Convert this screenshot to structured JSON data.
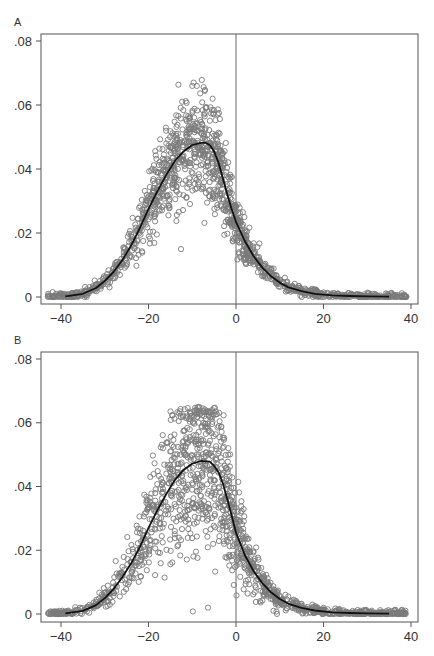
{
  "chart_data": [
    {
      "panel_label": "A",
      "type": "scatter",
      "title": "",
      "xlabel": "",
      "ylabel": "",
      "xlim": [
        -44,
        41
      ],
      "ylim": [
        0,
        0.08
      ],
      "xticks": [
        -40,
        -20,
        0,
        20,
        40
      ],
      "xtick_labels": [
        "−40",
        "−20",
        "0",
        "20",
        "40"
      ],
      "yticks": [
        0,
        0.02,
        0.04,
        0.06,
        0.08
      ],
      "ytick_labels": [
        "0",
        ".02",
        ".04",
        ".06",
        ".08"
      ],
      "reference_line_x": 0,
      "grid": false,
      "legend": "none",
      "series": [
        {
          "name": "observed",
          "kind": "scatter-hollow-circles",
          "color": "#7a7a7a",
          "x_range": [
            -43,
            39
          ],
          "peak_x": -8,
          "peak_y_max": 0.068,
          "noise_scale": 0.18
        },
        {
          "name": "fitted",
          "kind": "line",
          "color": "#111111",
          "x_range": [
            -39,
            35
          ],
          "points": [
            [
              -39,
              0.0002
            ],
            [
              -35,
              0.001
            ],
            [
              -32,
              0.0028
            ],
            [
              -30,
              0.005
            ],
            [
              -28,
              0.0078
            ],
            [
              -26,
              0.0115
            ],
            [
              -24,
              0.016
            ],
            [
              -22,
              0.0215
            ],
            [
              -20,
              0.0275
            ],
            [
              -18,
              0.033
            ],
            [
              -16,
              0.038
            ],
            [
              -14,
              0.0425
            ],
            [
              -12,
              0.0455
            ],
            [
              -10,
              0.0475
            ],
            [
              -8,
              0.0482
            ],
            [
              -7,
              0.0482
            ],
            [
              -6,
              0.0475
            ],
            [
              -5,
              0.0455
            ],
            [
              -4,
              0.042
            ],
            [
              -3,
              0.037
            ],
            [
              -2,
              0.032
            ],
            [
              -1,
              0.0275
            ],
            [
              0,
              0.0235
            ],
            [
              2,
              0.0175
            ],
            [
              4,
              0.0128
            ],
            [
              6,
              0.0092
            ],
            [
              8,
              0.0065
            ],
            [
              10,
              0.0045
            ],
            [
              12,
              0.003
            ],
            [
              15,
              0.0018
            ],
            [
              18,
              0.001
            ],
            [
              22,
              0.0005
            ],
            [
              26,
              0.0003
            ],
            [
              30,
              0.0002
            ],
            [
              35,
              0.0001
            ]
          ]
        }
      ]
    },
    {
      "panel_label": "B",
      "type": "scatter",
      "title": "",
      "xlabel": "",
      "ylabel": "",
      "xlim": [
        -44,
        41
      ],
      "ylim": [
        0,
        0.08
      ],
      "xticks": [
        -40,
        -20,
        0,
        20,
        40
      ],
      "xtick_labels": [
        "−40",
        "−20",
        "0",
        "20",
        "40"
      ],
      "yticks": [
        0,
        0.02,
        0.04,
        0.06,
        0.08
      ],
      "ytick_labels": [
        "0",
        ".02",
        ".04",
        ".06",
        ".08"
      ],
      "reference_line_x": 0,
      "grid": false,
      "legend": "none",
      "series": [
        {
          "name": "observed",
          "kind": "scatter-hollow-circles",
          "color": "#7a7a7a",
          "x_range": [
            -43,
            39
          ],
          "peak_x": -6,
          "peak_y_max": 0.065,
          "noise_scale": 0.28
        },
        {
          "name": "fitted",
          "kind": "line",
          "color": "#111111",
          "x_range": [
            -39,
            35
          ],
          "points": [
            [
              -39,
              0.0002
            ],
            [
              -35,
              0.001
            ],
            [
              -32,
              0.0028
            ],
            [
              -30,
              0.005
            ],
            [
              -28,
              0.0078
            ],
            [
              -26,
              0.0115
            ],
            [
              -24,
              0.0158
            ],
            [
              -22,
              0.021
            ],
            [
              -20,
              0.027
            ],
            [
              -18,
              0.0325
            ],
            [
              -16,
              0.0375
            ],
            [
              -14,
              0.042
            ],
            [
              -12,
              0.0452
            ],
            [
              -10,
              0.0472
            ],
            [
              -8,
              0.048
            ],
            [
              -6,
              0.0478
            ],
            [
              -5,
              0.0465
            ],
            [
              -4,
              0.0445
            ],
            [
              -3,
              0.041
            ],
            [
              -2,
              0.036
            ],
            [
              -1,
              0.031
            ],
            [
              0,
              0.0255
            ],
            [
              2,
              0.0185
            ],
            [
              4,
              0.0135
            ],
            [
              6,
              0.0097
            ],
            [
              8,
              0.0068
            ],
            [
              10,
              0.0047
            ],
            [
              12,
              0.0032
            ],
            [
              15,
              0.0019
            ],
            [
              18,
              0.0011
            ],
            [
              22,
              0.0005
            ],
            [
              26,
              0.0003
            ],
            [
              30,
              0.0002
            ],
            [
              35,
              0.0001
            ]
          ]
        }
      ]
    }
  ]
}
